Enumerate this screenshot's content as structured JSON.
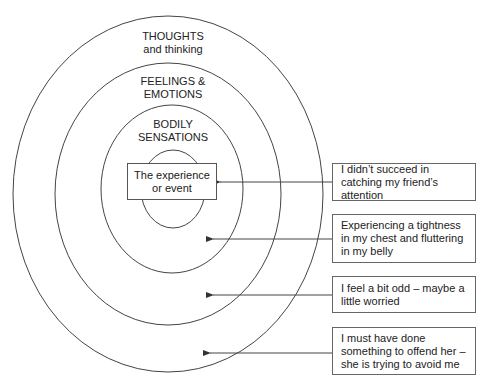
{
  "diagram": {
    "rings": [
      {
        "id": "thoughts",
        "line1": "THOUGHTS",
        "line2": "and thinking"
      },
      {
        "id": "feelings",
        "line1": "FEELINGS &",
        "line2": "EMOTIONS"
      },
      {
        "id": "bodily",
        "line1": "BODILY",
        "line2": "SENSATIONS"
      }
    ],
    "center": {
      "line1": "The experience",
      "line2": "or event"
    },
    "notes": [
      {
        "text": "I didn’t succeed in catching my friend’s attention",
        "points_to": "The experience or event"
      },
      {
        "text": "Experiencing a tightness in my chest and fluttering in my belly",
        "points_to": "BODILY SENSATIONS"
      },
      {
        "text": "I feel a bit odd – maybe a little worried",
        "points_to": "FEELINGS & EMOTIONS"
      },
      {
        "text": "I must have done something to offend her – she is trying to avoid me",
        "points_to": "THOUGHTS and thinking"
      }
    ]
  },
  "colors": {
    "stroke": "#444444",
    "background": "#ffffff",
    "text": "#222222"
  }
}
